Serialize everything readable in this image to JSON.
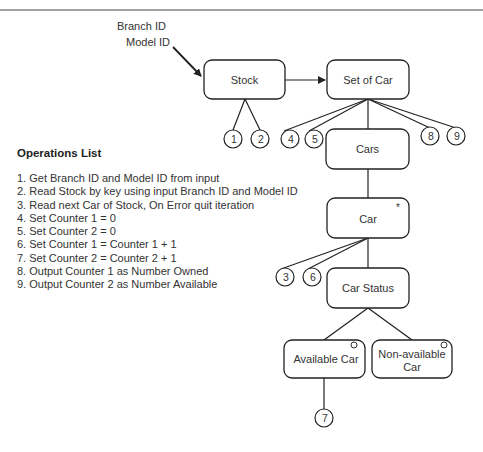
{
  "inputs": {
    "line1": "Branch ID",
    "line2": "Model ID"
  },
  "nodes": {
    "stock": "Stock",
    "set_of_car": "Set of Car",
    "cars": "Cars",
    "car": "Car",
    "car_marker": "*",
    "car_status": "Car Status",
    "available_car": "Available Car",
    "non_available_line1": "Non-available",
    "non_available_line2": "Car"
  },
  "operation_markers": [
    "1",
    "2",
    "3",
    "4",
    "5",
    "6",
    "7",
    "8",
    "9"
  ],
  "operations": {
    "title": "Operations List",
    "items": [
      "1.  Get Branch ID and Model ID from input",
      "2.  Read Stock by key using input Branch ID and Model ID",
      "3.  Read next Car of Stock, On Error quit iteration",
      "4.  Set Counter 1 = 0",
      "5.  Set Counter 2 = 0",
      "6.  Set Counter 1 = Counter 1 + 1",
      "7.  Set Counter 2 = Counter 2 + 1",
      "8.  Output Counter 1 as Number Owned",
      "9.  Output Counter 2 as Number Available"
    ]
  }
}
